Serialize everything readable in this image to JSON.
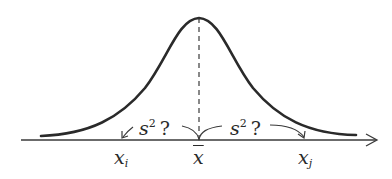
{
  "diagram": {
    "type": "normal-distribution-variance-illustration",
    "curve": "bell-shaped normal density",
    "colors": {
      "stroke": "#2a2a2a",
      "background": "#ffffff"
    },
    "axis": {
      "has_arrow": true,
      "direction": "right"
    },
    "mean_line": {
      "style": "dashed",
      "position": "x̄"
    },
    "points": {
      "left": {
        "base": "x",
        "subscript": "i"
      },
      "mean": {
        "base": "x"
      },
      "right": {
        "base": "x",
        "subscript": "j"
      }
    },
    "annotations": {
      "left": {
        "base": "s",
        "superscript": "2",
        "suffix": "?"
      },
      "right": {
        "base": "s",
        "superscript": "2",
        "suffix": "?"
      }
    }
  }
}
